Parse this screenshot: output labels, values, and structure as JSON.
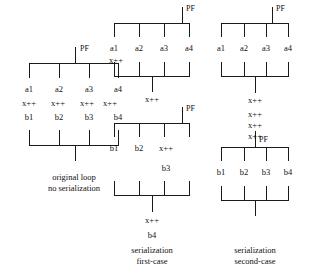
{
  "figure": {
    "background_color": "#ffffff",
    "line_color": "#1a1a1a",
    "text_color": "#111111"
  },
  "diagrams": [
    {
      "id": "original-loop",
      "caption_lines": [
        "original  loop",
        "no serialization"
      ],
      "fork_label": "PF",
      "branch_labels": [
        "a1",
        "a2",
        "a3",
        "a4"
      ],
      "increment_labels": [
        "x++",
        "x++",
        "x++",
        "x++"
      ],
      "second_labels": [
        "b1",
        "b2",
        "b3",
        "b4"
      ],
      "branch_count": 4
    },
    {
      "id": "serialization-first-case",
      "caption_lines": [
        "serialization",
        "first-case"
      ],
      "fork_label_top": "PF",
      "fork_label_mid": "PF",
      "branch_labels_top": [
        "a1",
        "a2",
        "a3",
        "a4"
      ],
      "increment_top": "x++",
      "join_increment_top": "x++",
      "branch_labels_mid": [
        "b1",
        "b2",
        "x++"
      ],
      "increment_mid": "b3",
      "join_increment_mid": "x++",
      "tail_label": "b4",
      "branch_count": 4
    },
    {
      "id": "serialization-second-case",
      "caption_lines": [
        "serialization",
        "second-case"
      ],
      "fork_label_top": "PF",
      "fork_label_bottom": "PF",
      "branch_labels_top": [
        "a1",
        "a2",
        "a3",
        "a4"
      ],
      "join_increment": "x++",
      "increment_stack": [
        "x++",
        "x++",
        "x++"
      ],
      "branch_labels_bottom": [
        "b1",
        "b2",
        "b3",
        "b4"
      ],
      "branch_count": 4
    }
  ]
}
